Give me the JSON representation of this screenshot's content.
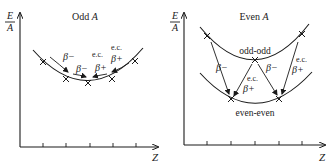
{
  "panels": [
    {
      "title_prefix": "Odd ",
      "title_var": "A",
      "y_axis_label_num": "E",
      "y_axis_label_den": "A",
      "x_axis_label": "Z",
      "labels": {
        "beta_minus_1": "β−",
        "beta_minus_2": "β−",
        "ec_1": "e.c.",
        "beta_plus_1": "β+",
        "ec_2": "e.c.",
        "beta_plus_2": "β+"
      }
    },
    {
      "title_prefix": "Even ",
      "title_var": "A",
      "y_axis_label_num": "E",
      "y_axis_label_den": "A",
      "x_axis_label": "Z",
      "upper_curve_label": "odd-odd",
      "lower_curve_label": "even-even",
      "labels": {
        "beta_minus_1": "β−",
        "beta_minus_2": "β−",
        "ec_1": "e.c.",
        "beta_plus_1": "β+",
        "ec_2": "e.c.",
        "beta_plus_2": "β+"
      }
    }
  ],
  "colors": {
    "ink": "#1a1a1a",
    "background": "#ffffff"
  }
}
